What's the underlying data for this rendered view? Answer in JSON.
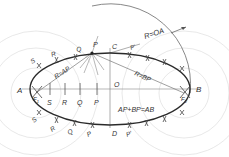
{
  "diagram": {
    "colors": {
      "ink": "#2a2a2a",
      "construction": "#cfcfcf",
      "text": "#333333",
      "background": "#ffffff"
    },
    "labels": {
      "A": "A",
      "B": "B",
      "C": "C",
      "D": "D",
      "O": "O",
      "F1": "F",
      "F1_sub": "1",
      "F2": "F",
      "F2_sub": "2",
      "S": "S",
      "R": "R",
      "Q": "Q",
      "P": "P",
      "P_upper": "P",
      "Q_upper": "Q",
      "R_upper": "R",
      "S_upper": "S",
      "P_prime_upper": "P'",
      "P_prime_lower": "P'",
      "P_lower": "P",
      "Q_lower": "Q",
      "R_lower": "R",
      "S_lower": "S",
      "R_eq_OA": "R=OA",
      "R_eq_AP": "R=AP",
      "R_eq_BP": "R=BP",
      "sum_rule": "AP+BP=AB"
    }
  }
}
